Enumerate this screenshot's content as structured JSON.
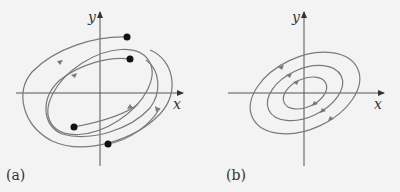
{
  "figure": {
    "background": "#f3f3f3",
    "axis_color": "#555555",
    "curve_color": "#7a7a7a",
    "point_color": "#111111",
    "panels": [
      {
        "caption": "(a)",
        "x_label": "x",
        "y_label": "y",
        "description": "Spiral trajectories approaching a tilted elliptical limit cycle from inside and outside"
      },
      {
        "caption": "(b)",
        "x_label": "x",
        "y_label": "y",
        "description": "Concentric tilted elliptical closed orbits (center), counter-clockwise"
      }
    ]
  }
}
